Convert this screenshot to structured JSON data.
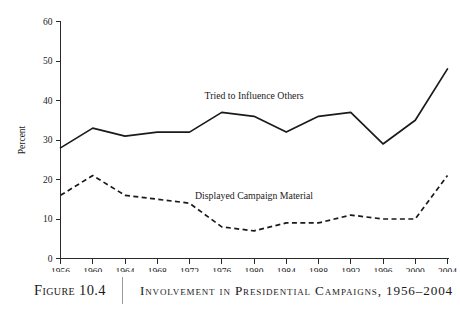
{
  "caption": {
    "figure_number": "Figure 10.4",
    "title": "Involvement in Presidential Campaigns, 1956–2004"
  },
  "chart_data": {
    "type": "line",
    "title": "Involvement in Presidential Campaigns, 1956–2004",
    "xlabel": "",
    "ylabel": "Percent",
    "categories": [
      1956,
      1960,
      1964,
      1968,
      1972,
      1976,
      1980,
      1984,
      1988,
      1992,
      1996,
      2000,
      2004
    ],
    "xtick_labels": [
      "1956",
      "1960",
      "1964",
      "1968",
      "1972",
      "1976",
      "1980",
      "1984",
      "1988",
      "1992",
      "1996",
      "2000",
      "2004"
    ],
    "ytick_labels": [
      "0",
      "10",
      "20",
      "30",
      "40",
      "50",
      "60"
    ],
    "yticks": [
      0,
      10,
      20,
      30,
      40,
      50,
      60
    ],
    "ylim": [
      0,
      60
    ],
    "xlim": [
      1956,
      2004
    ],
    "grid": false,
    "legend_position": "inline-annotation",
    "series": [
      {
        "name": "Tried to Influence Others",
        "style": "solid",
        "color": "#1a1a1a",
        "values": [
          28,
          33,
          31,
          32,
          32,
          37,
          36,
          32,
          36,
          37,
          29,
          35,
          48
        ]
      },
      {
        "name": "Displayed Campaign Material",
        "style": "dashed",
        "color": "#1a1a1a",
        "values": [
          16,
          21,
          16,
          15,
          14,
          8,
          7,
          9,
          9,
          11,
          10,
          10,
          21
        ]
      }
    ],
    "annotations": [
      {
        "text": "Tried to Influence Others",
        "x": 1980,
        "y": 40.5
      },
      {
        "text": "Displayed Campaign Material",
        "x": 1980,
        "y": 15.0
      }
    ]
  }
}
